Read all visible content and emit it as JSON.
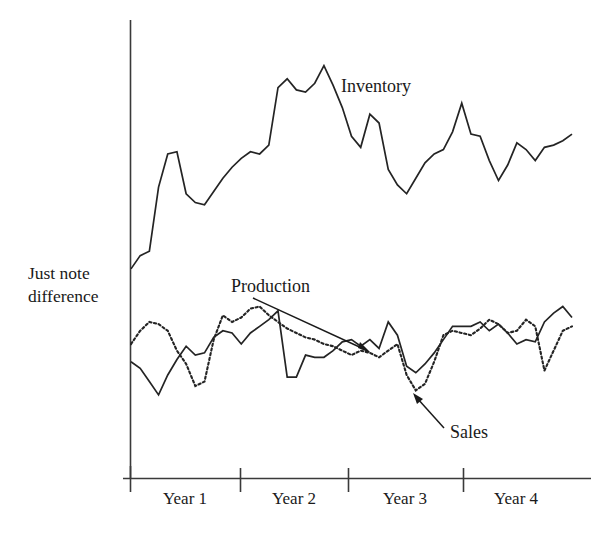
{
  "figure": {
    "background_color": "#ffffff",
    "ink_color": "#1a1a1a",
    "width": 606,
    "height": 547
  },
  "chart_data": {
    "type": "line",
    "title": "",
    "subtitle": "",
    "xlabel": "",
    "ylabel": "Just note difference",
    "ylabel_lines": [
      "Just note",
      "difference"
    ],
    "grid": false,
    "legend_position": "inline-annotations",
    "axis": {
      "x_axis_visible": true,
      "y_axis_visible": true,
      "x_tick_labels": [
        "Year 1",
        "Year 2",
        "Year 3",
        "Year 4"
      ],
      "y_tick_labels": [],
      "xlim": [
        0,
        48
      ],
      "ylim": [
        0,
        100
      ],
      "x_ticks_at": [
        0,
        12,
        24,
        36
      ],
      "note": "Y axis is unlabeled / arbitrary units anchored at the just-noticeable-difference level"
    },
    "x": [
      0,
      1,
      2,
      3,
      4,
      5,
      6,
      7,
      8,
      9,
      10,
      11,
      12,
      13,
      14,
      15,
      16,
      17,
      18,
      19,
      20,
      21,
      22,
      23,
      24,
      25,
      26,
      27,
      28,
      29,
      30,
      31,
      32,
      33,
      34,
      35,
      36,
      37,
      38,
      39,
      40,
      41,
      42,
      43,
      44,
      45,
      46,
      47,
      48
    ],
    "series": [
      {
        "name": "Inventory",
        "style": "solid",
        "color": "#242424",
        "label": "Inventory",
        "label_x": 37.5,
        "label_y": 91,
        "values": [
          45.5,
          48.5,
          49.5,
          64.0,
          71.5,
          72.0,
          62.5,
          60.5,
          60.0,
          63.0,
          66.0,
          68.5,
          70.5,
          72.0,
          71.5,
          73.5,
          86.5,
          88.5,
          86.0,
          85.5,
          87.5,
          91.5,
          87.0,
          82.0,
          75.5,
          73.0,
          80.5,
          78.5,
          68.0,
          64.5,
          62.5,
          66.0,
          69.5,
          71.5,
          72.5,
          76.5,
          83.0,
          76.0,
          75.5,
          70.0,
          65.5,
          69.0,
          74.0,
          72.5,
          70.0,
          73.0,
          73.5,
          74.5,
          76.0
        ]
      },
      {
        "name": "Production",
        "style": "solid",
        "color": "#242424",
        "label": "Production",
        "label_x": 14.0,
        "label_y": 47.5,
        "arrow_from_x": 17.5,
        "arrow_from_y": 44.5,
        "arrow_to_x": 26.0,
        "arrow_to_y": 32.5,
        "values": [
          24.5,
          23.0,
          20.0,
          17.0,
          21.5,
          25.0,
          28.0,
          26.0,
          26.5,
          30.0,
          31.5,
          31.0,
          28.5,
          31.0,
          32.5,
          34.0,
          36.0,
          21.0,
          21.0,
          26.0,
          25.5,
          25.5,
          27.0,
          29.0,
          29.5,
          28.0,
          29.5,
          27.5,
          33.5,
          30.5,
          23.5,
          22.0,
          24.0,
          26.5,
          29.5,
          32.5,
          32.5,
          32.5,
          33.5,
          31.5,
          33.0,
          31.0,
          28.5,
          29.5,
          29.0,
          33.5,
          35.5,
          37.0,
          34.5
        ]
      },
      {
        "name": "Sales",
        "style": "dotted",
        "color": "#242424",
        "label": "Sales",
        "label_x": 36.0,
        "label_y": 13.5,
        "arrow_from_x": 34.0,
        "arrow_from_y": 16.0,
        "arrow_to_x": 30.5,
        "arrow_to_y": 23.0,
        "values": [
          28.5,
          31.5,
          33.5,
          33.0,
          31.5,
          27.0,
          24.0,
          19.0,
          20.0,
          29.5,
          35.0,
          33.5,
          34.5,
          36.5,
          37.0,
          35.0,
          33.5,
          32.0,
          31.0,
          30.0,
          29.5,
          28.5,
          28.0,
          27.0,
          26.0,
          27.0,
          26.5,
          25.5,
          27.0,
          28.5,
          21.5,
          18.0,
          19.5,
          24.5,
          30.5,
          31.5,
          31.0,
          30.5,
          32.0,
          34.0,
          33.0,
          31.0,
          31.5,
          34.0,
          32.5,
          22.5,
          27.0,
          31.5,
          32.5
        ]
      }
    ]
  },
  "labels": {
    "y_axis_line1": "Just note",
    "y_axis_line2": "difference",
    "inventory": "Inventory",
    "production": "Production",
    "sales": "Sales",
    "year1": "Year 1",
    "year2": "Year 2",
    "year3": "Year 3",
    "year4": "Year 4"
  }
}
